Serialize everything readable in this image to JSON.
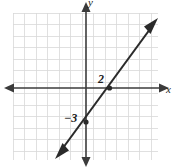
{
  "figure": {
    "kind": "coordinate-plane-line-graph",
    "width": 178,
    "height": 168,
    "background_color": "#ffffff"
  },
  "axes": {
    "x_axis_label": "x",
    "y_axis_label": "y",
    "x_axis_color": "#3b3b3b",
    "y_axis_color": "#3b3b3b",
    "x_axis_pixel_y": 88,
    "y_axis_pixel_x": 86,
    "arrowheads": "both-ends"
  },
  "grid": {
    "visible": true,
    "color": "#d8d8d8",
    "cell_size_px": 11.5,
    "left_px": 13,
    "top_px": 13,
    "right_px": 158,
    "bottom_px": 160,
    "columns": 13,
    "rows": 13
  },
  "labels": {
    "x_intercept_label": "2",
    "y_intercept_label": "−3"
  },
  "chart_data": {
    "type": "line",
    "title": "",
    "xlabel": "x",
    "ylabel": "y",
    "grid": true,
    "legend": "none",
    "xlim": [
      -6.3,
      6.3
    ],
    "ylim": [
      -6.3,
      6.3
    ],
    "xticks": [
      2
    ],
    "yticks": [
      -3
    ],
    "xticklabels": [
      "2"
    ],
    "yticklabels": [
      "−3"
    ],
    "annotations": [
      "2",
      "−3"
    ],
    "series": [
      {
        "name": "line",
        "equation": "y = 1.5x - 3",
        "slope": 1.5,
        "intercept": -3,
        "arrowheads": "both-ends",
        "color": "#2a2a2a",
        "x": [
          -2.4,
          6.0
        ],
        "y": [
          -6.6,
          6.0
        ]
      }
    ],
    "points": [
      {
        "name": "x-intercept",
        "x": 2,
        "y": 0,
        "label": "2"
      },
      {
        "name": "y-intercept",
        "x": 0,
        "y": -3,
        "label": "−3"
      }
    ]
  }
}
